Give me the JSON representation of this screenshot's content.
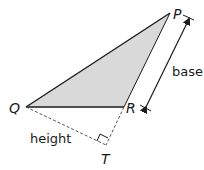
{
  "diagram": {
    "title": "",
    "vertices": {
      "P": {
        "label": "P",
        "x": 170,
        "y": 13
      },
      "Q": {
        "label": "Q",
        "x": 26,
        "y": 107
      },
      "R": {
        "label": "R",
        "x": 124,
        "y": 107
      },
      "T": {
        "label": "T",
        "x": 106,
        "y": 145
      }
    },
    "labels": {
      "base": "base",
      "height": "height"
    },
    "colors": {
      "fill": "#d9d9d9",
      "stroke": "#1a1a1a",
      "dashed": "#555555"
    }
  }
}
